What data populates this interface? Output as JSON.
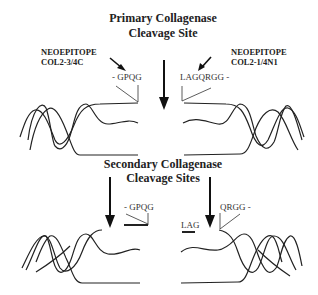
{
  "diagram": {
    "primary_title": {
      "line1": "Primary Collagenase",
      "line2": "Cleavage Site"
    },
    "secondary_title": {
      "line1": "Secondary Collagenase",
      "line2": "Cleavage Sites"
    },
    "left_neoepitope": {
      "line1": "NEOEPITOPE",
      "line2": "COL2-3/4C"
    },
    "right_neoepitope": {
      "line1": "NEOEPITOPE",
      "line2": "COL2-1/4N1"
    },
    "sequences": {
      "top_left": "- GPQG",
      "top_right": "LAGQRGG -",
      "bottom_left": "- GPQG",
      "bottom_lag": "LAG",
      "bottom_right": "QRGG -"
    },
    "colors": {
      "stroke": "#222222",
      "background": "#ffffff"
    }
  }
}
